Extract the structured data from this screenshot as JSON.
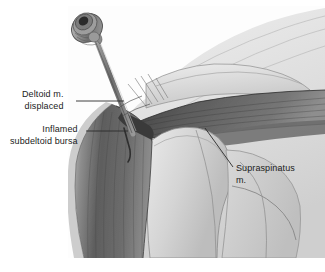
{
  "figure": {
    "type": "medical-illustration",
    "style": "grayscale anatomical line and wash drawing",
    "background_color": "#ffffff",
    "canvas": {
      "width": 325,
      "height": 272
    },
    "art_bounds": {
      "x": 68,
      "y": 6,
      "width": 257,
      "height": 252
    }
  },
  "labels": {
    "deltoid": {
      "line1": "Deltoid m.",
      "line2": "displaced",
      "leader": "horizontal line from text to deltoid muscle under skin"
    },
    "bursa": {
      "line1": "Inflamed",
      "line2": "subdeltoid bursa",
      "leader": "horizontal line from text to inflamed bursa at needle tip"
    },
    "supraspinatus": {
      "line1": "Supraspinatus",
      "line2": "m.",
      "leader": "diagonal line from text up-left to supraspinatus muscle belly"
    }
  },
  "anatomy": [
    {
      "name": "deltoid-muscle",
      "tone": "#6e6e6e",
      "note": "dark striated curved muscle mass on left, displaced by needle"
    },
    {
      "name": "subdeltoid-bursa",
      "tone": "#4a4a4a",
      "note": "inflamed dark slit beneath deltoid at needle tip"
    },
    {
      "name": "supraspinatus-muscle",
      "tone": "#5a5a5a",
      "note": "dark tendon band running to greater tuberosity"
    },
    {
      "name": "acromion",
      "tone": "#c9c9c9",
      "note": "bony shelf above the joint"
    },
    {
      "name": "humerus",
      "tone": "#d2d2d2",
      "note": "humeral head and shaft, center"
    },
    {
      "name": "scapula",
      "tone": "#c4c4c4",
      "note": "blade visible behind humerus, right"
    },
    {
      "name": "skin-contour",
      "tone": "#dcdcdc",
      "note": "shoulder surface shading, upper right"
    }
  ],
  "instrument": {
    "name": "needle-with-luer-lock-hub",
    "hub_color": "#8a8a8a",
    "shaft_color": "#7e7e7e",
    "note": "hypodermic needle entering lateral shoulder, angled down-right toward subdeltoid bursa"
  },
  "colors": {
    "ink": "#1b1b1b",
    "leader": "#2a2a2a",
    "paper": "#ffffff",
    "muscle_dark": "#5d5d5d",
    "bone_light": "#d6d6d6"
  }
}
